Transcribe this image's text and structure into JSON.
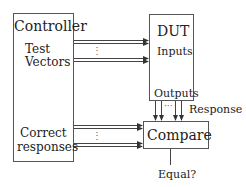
{
  "diagram": {
    "controller": {
      "title": "Controller",
      "test_vectors_line1": "Test",
      "test_vectors_line2": "Vectors",
      "correct_line1": "Correct",
      "correct_line2": "responses"
    },
    "dut": {
      "title": "DUT",
      "inputs": "Inputs",
      "outputs": "Outputs"
    },
    "compare": {
      "title": "Compare",
      "result": "Equal?"
    },
    "response_label": "Response",
    "ellipsis_vertical": "⋮",
    "ellipsis_horizontal": "···",
    "colors": {
      "line": "#444444",
      "box_border": "#555555",
      "text": "#222222"
    }
  }
}
